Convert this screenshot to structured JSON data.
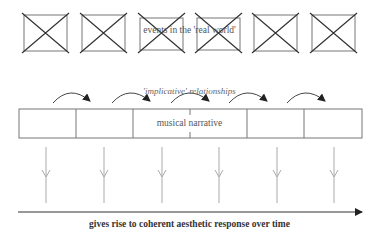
{
  "diagram": {
    "events_label": "events in the 'real world'",
    "implicative_label": "'implicative' relationships",
    "narrative_label": "musical narrative",
    "caption": "gives rise to coherent aesthetic response over time",
    "event_boxes": 6,
    "narrative_segments": 6,
    "implication_arrows": 5,
    "downward_arrows": 6,
    "colors": {
      "stroke": "#666666",
      "cross": "#333333",
      "text": "#555555",
      "caption": "#333333",
      "timeline": "#333333"
    }
  }
}
